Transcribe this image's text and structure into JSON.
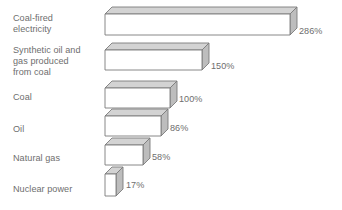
{
  "chart_data": {
    "type": "bar",
    "title": "",
    "subtitle": "",
    "xlabel": "",
    "ylabel": "",
    "orientation": "horizontal",
    "style": "3d-isometric-bars",
    "grid": false,
    "legend": false,
    "axis_visible": false,
    "unit": "%",
    "baseline_category": "Coal",
    "baseline_value": 100,
    "xlim": [
      0,
      286
    ],
    "categories": [
      "Coal-fired\nelectricity",
      "Synthetic oil and\ngas produced\nfrom coal",
      "Coal",
      "Oil",
      "Natural gas",
      "Nuclear power"
    ],
    "values": [
      286,
      150,
      100,
      86,
      58,
      17
    ],
    "value_labels": [
      "286%",
      "150%",
      "100%",
      "86%",
      "58%",
      "17%"
    ],
    "colors": {
      "front_face": "#ffffff",
      "top_face": "#d3d3d3",
      "side_face": "#bdbdbd",
      "outline": "#7c7c7c",
      "text": "#6e6e6e",
      "background": "#ffffff"
    }
  },
  "bars": [
    {
      "label": "Coal-fired\nelectricity",
      "value_label": "286%",
      "value": 286,
      "label_top": 13,
      "bar_y": 14,
      "width": 185,
      "height": 21,
      "value_x": 299,
      "value_y": 26
    },
    {
      "label": "Synthetic oil and\ngas produced\nfrom coal",
      "value_label": "150%",
      "value": 150,
      "label_top": 45,
      "bar_y": 50,
      "width": 97,
      "height": 20,
      "value_x": 211,
      "value_y": 61
    },
    {
      "label": "Coal",
      "value_label": "100%",
      "value": 100,
      "label_top": 92,
      "bar_y": 88,
      "width": 65,
      "height": 20,
      "value_x": 179,
      "value_y": 94
    },
    {
      "label": "Oil",
      "value_label": "86%",
      "value": 86,
      "label_top": 124,
      "bar_y": 116,
      "width": 56,
      "height": 20,
      "value_x": 170,
      "value_y": 123
    },
    {
      "label": "Natural gas",
      "value_label": "58%",
      "value": 58,
      "label_top": 153,
      "bar_y": 145,
      "width": 38,
      "height": 20,
      "value_x": 152,
      "value_y": 152
    },
    {
      "label": "Nuclear power",
      "value_label": "17%",
      "value": 17,
      "label_top": 184,
      "bar_y": 174,
      "width": 11,
      "height": 22,
      "value_x": 126,
      "value_y": 180
    }
  ],
  "geometry": {
    "bar_left": 105,
    "depth_x": 7,
    "depth_y": 7
  }
}
